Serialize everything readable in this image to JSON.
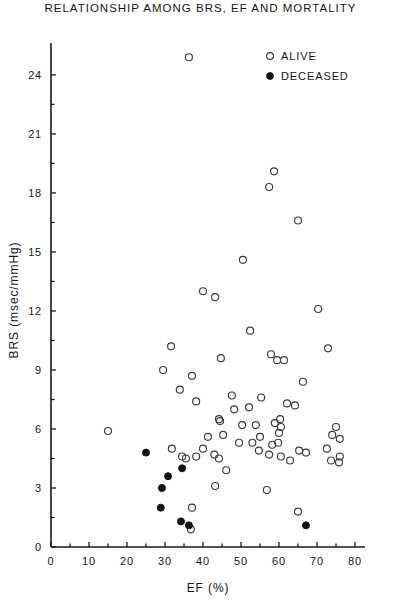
{
  "chart_data": {
    "type": "scatter",
    "title": "RELATIONSHIP AMONG BRS, EF AND MORTALITY",
    "xlabel": "EF (%)",
    "ylabel": "BRS (msec/mmHg)",
    "xlim": [
      0,
      84
    ],
    "ylim": [
      0,
      25.5
    ],
    "xticks": [
      0,
      10,
      20,
      30,
      40,
      50,
      60,
      70,
      80
    ],
    "xtick_labels": [
      "0",
      "10",
      "20",
      "30",
      "40",
      "50",
      "60",
      "70",
      "80"
    ],
    "yticks": [
      0,
      3,
      6,
      9,
      12,
      15,
      18,
      21,
      24
    ],
    "ytick_labels": [
      "0",
      "3",
      "6",
      "9",
      "12",
      "15",
      "18",
      "21",
      "24"
    ],
    "grid": false,
    "legend_position": "top-right",
    "series": [
      {
        "name": "ALIVE",
        "marker": "open-circle",
        "color": "#3b3b3b",
        "points": [
          [
            36.3,
            24.9
          ],
          [
            58.7,
            19.1
          ],
          [
            57.4,
            18.3
          ],
          [
            65.0,
            16.6
          ],
          [
            50.5,
            14.6
          ],
          [
            40.0,
            13.0
          ],
          [
            43.2,
            12.7
          ],
          [
            70.3,
            12.1
          ],
          [
            52.4,
            11.0
          ],
          [
            31.6,
            10.2
          ],
          [
            44.7,
            9.6
          ],
          [
            57.9,
            9.8
          ],
          [
            59.5,
            9.5
          ],
          [
            61.3,
            9.5
          ],
          [
            72.9,
            10.1
          ],
          [
            29.5,
            9.0
          ],
          [
            37.1,
            8.7
          ],
          [
            66.3,
            8.4
          ],
          [
            33.9,
            8.0
          ],
          [
            38.2,
            7.4
          ],
          [
            47.6,
            7.7
          ],
          [
            55.3,
            7.6
          ],
          [
            48.2,
            7.0
          ],
          [
            52.1,
            7.1
          ],
          [
            62.1,
            7.3
          ],
          [
            64.2,
            7.2
          ],
          [
            44.2,
            6.5
          ],
          [
            44.5,
            6.4
          ],
          [
            50.3,
            6.2
          ],
          [
            53.9,
            6.2
          ],
          [
            58.9,
            6.3
          ],
          [
            60.5,
            6.1
          ],
          [
            60.3,
            6.5
          ],
          [
            75.0,
            6.1
          ],
          [
            41.3,
            5.6
          ],
          [
            45.3,
            5.7
          ],
          [
            55.0,
            5.6
          ],
          [
            58.2,
            5.2
          ],
          [
            59.8,
            5.3
          ],
          [
            60.0,
            5.8
          ],
          [
            74.0,
            5.7
          ],
          [
            76.0,
            5.5
          ],
          [
            40.0,
            5.0
          ],
          [
            31.8,
            5.0
          ],
          [
            49.5,
            5.3
          ],
          [
            53.0,
            5.3
          ],
          [
            34.5,
            4.6
          ],
          [
            38.2,
            4.6
          ],
          [
            65.3,
            4.9
          ],
          [
            67.1,
            4.8
          ],
          [
            72.6,
            5.0
          ],
          [
            76.0,
            4.6
          ],
          [
            43.0,
            4.7
          ],
          [
            44.2,
            4.5
          ],
          [
            54.7,
            4.9
          ],
          [
            57.4,
            4.7
          ],
          [
            60.5,
            4.6
          ],
          [
            62.9,
            4.4
          ],
          [
            73.7,
            4.4
          ],
          [
            75.8,
            4.3
          ],
          [
            15.0,
            5.9
          ],
          [
            35.5,
            4.5
          ],
          [
            46.1,
            3.9
          ],
          [
            43.2,
            3.1
          ],
          [
            56.8,
            2.9
          ],
          [
            37.1,
            2.0
          ],
          [
            65.0,
            1.8
          ],
          [
            36.8,
            0.9
          ]
        ]
      },
      {
        "name": "DECEASED",
        "marker": "filled-circle",
        "color": "#111111",
        "points": [
          [
            25.0,
            4.8
          ],
          [
            34.5,
            4.0
          ],
          [
            30.8,
            3.6
          ],
          [
            29.2,
            3.0
          ],
          [
            28.9,
            2.0
          ],
          [
            34.2,
            1.3
          ],
          [
            36.3,
            1.1
          ],
          [
            67.1,
            1.1
          ]
        ]
      }
    ]
  },
  "legend": {
    "items": [
      {
        "label": "ALIVE",
        "marker": "open-circle"
      },
      {
        "label": "DECEASED",
        "marker": "filled-circle"
      }
    ]
  }
}
